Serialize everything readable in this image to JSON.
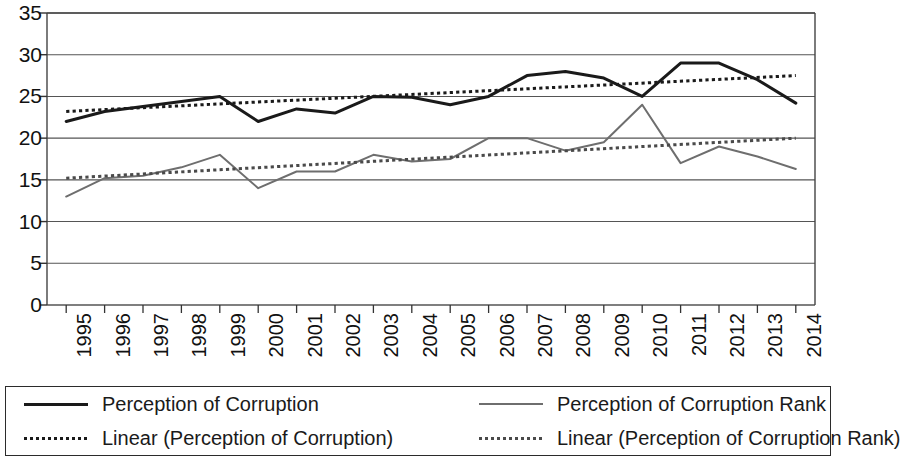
{
  "chart_data": {
    "type": "line",
    "title": "",
    "subtitle": "",
    "xlabel": "",
    "ylabel": "",
    "ylim": [
      0,
      35
    ],
    "y_ticks": [
      0,
      5,
      10,
      15,
      20,
      25,
      30,
      35
    ],
    "grid": true,
    "legend_position": "bottom",
    "x": [
      "1995",
      "1996",
      "1997",
      "1998",
      "1999",
      "2000",
      "2001",
      "2002",
      "2003",
      "2004",
      "2005",
      "2006",
      "2007",
      "2008",
      "2009",
      "2010",
      "2011",
      "2012",
      "2013",
      "2014"
    ],
    "series": [
      {
        "name": "Perception of Corruption",
        "style": "solid",
        "color": "#1a1a1a",
        "width": 3,
        "values": [
          22.0,
          23.2,
          23.8,
          24.4,
          25.0,
          22.0,
          23.5,
          23.0,
          25.0,
          24.9,
          24.0,
          25.0,
          27.5,
          28.0,
          27.2,
          25.0,
          29.0,
          29.0,
          27.0,
          26.5
        ]
      },
      {
        "name": "Perception of Corruption Rank",
        "style": "solid",
        "color": "#6e6e6e",
        "width": 2,
        "values": [
          13.0,
          15.2,
          15.5,
          16.5,
          18.0,
          14.0,
          16.0,
          16.0,
          18.0,
          17.2,
          17.5,
          20.0,
          20.0,
          18.5,
          19.5,
          24.0,
          17.0,
          19.0,
          17.8,
          16.3
        ]
      },
      {
        "name": "Linear (Perception of Corruption)",
        "style": "dotted",
        "color": "#1a1a1a",
        "width": 3,
        "trend": true,
        "endpoints": [
          23.2,
          27.5
        ]
      },
      {
        "name": "Linear (Perception of Corruption Rank)",
        "style": "dotted",
        "color": "#4a4a4a",
        "width": 3,
        "trend": true,
        "endpoints": [
          15.2,
          20.0
        ]
      }
    ],
    "series_corrected": {
      "perception_of_corruption": [
        22.0,
        23.2,
        23.8,
        24.4,
        25.0,
        22.0,
        23.5,
        23.0,
        25.0,
        24.9,
        24.0,
        25.0,
        27.5,
        28.0,
        27.2,
        25.0,
        29.0,
        29.0,
        27.0,
        24.2
      ],
      "perception_of_corruption_rank": [
        13.0,
        15.2,
        15.5,
        16.5,
        18.0,
        14.0,
        16.0,
        16.0,
        18.0,
        17.2,
        17.5,
        20.0,
        20.0,
        18.5,
        19.5,
        24.0,
        17.0,
        19.0,
        17.8,
        16.3
      ]
    }
  },
  "legend": {
    "entries": [
      {
        "label": "Perception of Corruption",
        "style": "solid",
        "color": "#1a1a1a"
      },
      {
        "label": "Perception of Corruption Rank",
        "style": "solid",
        "color": "#6e6e6e"
      },
      {
        "label": "Linear (Perception of Corruption)",
        "style": "dotted",
        "color": "#1a1a1a"
      },
      {
        "label": "Linear (Perception of Corruption Rank)",
        "style": "dotted",
        "color": "#4a4a4a"
      }
    ]
  },
  "axes": {
    "y_ticks": [
      "35",
      "30",
      "25",
      "20",
      "15",
      "10",
      "5",
      "0"
    ],
    "x_ticks": [
      "1995",
      "1996",
      "1997",
      "1998",
      "1999",
      "2000",
      "2001",
      "2002",
      "2003",
      "2004",
      "2005",
      "2006",
      "2007",
      "2008",
      "2009",
      "2010",
      "2011",
      "2012",
      "2013",
      "2014"
    ]
  }
}
